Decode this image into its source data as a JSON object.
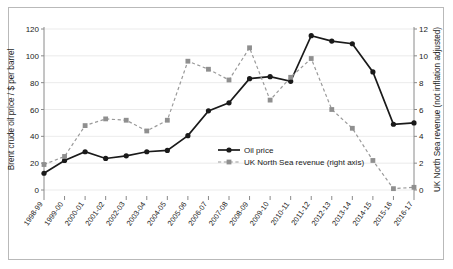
{
  "chart_data": {
    "type": "line",
    "title": "",
    "xlabel": "",
    "grid": true,
    "legend_position": "inside-center-right",
    "categories": [
      "1998-99",
      "1999-00",
      "2000-01",
      "2001-02",
      "2002-03",
      "2003-04",
      "2004-05",
      "2005-06",
      "2006-07",
      "2007-08",
      "2008-09",
      "2009-10",
      "2010-11",
      "2011-12",
      "2012-13",
      "2013-14",
      "2014-15",
      "2015-16",
      "2016-17"
    ],
    "axes": {
      "left": {
        "label": "Brent crude oil price / $ per barrel",
        "ylim": [
          0,
          120
        ],
        "ticks": [
          0,
          20,
          40,
          60,
          80,
          100,
          120
        ],
        "tick_labels": [
          "0",
          "20",
          "40",
          "60",
          "80",
          "100",
          "120"
        ]
      },
      "right": {
        "label": "UK North Sea revenue (not inflation adjusted)",
        "ylim": [
          0,
          12
        ],
        "ticks": [
          0,
          2,
          4,
          6,
          8,
          10,
          12
        ],
        "tick_labels": [
          "0",
          "2",
          "4",
          "6",
          "8",
          "10",
          "12"
        ]
      }
    },
    "series": [
      {
        "name": "Oil price",
        "legend_label": "Oil price",
        "axis": "left",
        "color": "#1a1a1a",
        "line_style": "solid",
        "marker": "circle",
        "values": [
          12.5,
          22.0,
          28.5,
          23.5,
          25.5,
          28.5,
          29.5,
          40.5,
          59.0,
          65.0,
          83.0,
          84.5,
          81.0,
          115.0,
          111.0,
          109.0,
          88.0,
          49.0,
          50.0
        ]
      },
      {
        "name": "UK North Sea revenue (right axis)",
        "legend_label": "UK North Sea revenue (right axis)",
        "axis": "right",
        "color": "#8f8f8f",
        "line_style": "dashed",
        "marker": "square",
        "values": [
          1.9,
          2.5,
          4.8,
          5.3,
          5.2,
          4.4,
          5.2,
          9.6,
          9.0,
          8.2,
          10.6,
          6.7,
          8.4,
          9.8,
          6.0,
          4.6,
          2.2,
          0.1,
          0.2
        ]
      }
    ]
  }
}
